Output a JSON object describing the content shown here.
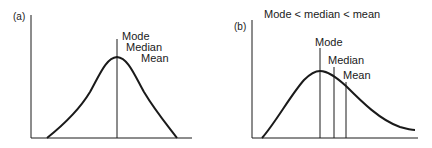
{
  "panel_a": {
    "label": "(a)",
    "annotations": {
      "mode": "Mode",
      "median": "Median",
      "mean": "Mean"
    },
    "description": "Symmetric distribution: mode, median and mean coincide"
  },
  "panel_b": {
    "label": "(b)",
    "title": "Mode < median < mean",
    "annotations": {
      "mode": "Mode",
      "median": "Median",
      "mean": "Mean"
    },
    "description": "Positively skewed distribution"
  },
  "colors": {
    "ink": "#1a1a1a",
    "background": "#ffffff"
  }
}
